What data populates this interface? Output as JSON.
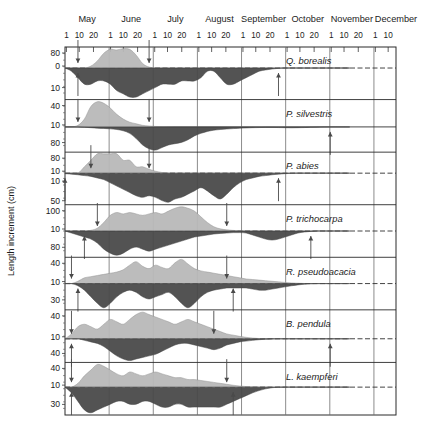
{
  "figure": {
    "y_axis_label": "Length increment (cm)",
    "x_axis_months": [
      "May",
      "June",
      "July",
      "August",
      "September",
      "October",
      "November",
      "December"
    ],
    "x_tick_labels_per_month": [
      "1",
      "10",
      "20"
    ],
    "x_last_month_ticks": [
      "1",
      "10"
    ],
    "colors": {
      "shoot_fill": "#b9b9b9",
      "root_fill": "#4a4a4a",
      "frame": "#2a2a2a",
      "gridline": "#6f6f6f",
      "baseline": "#2f2f2f",
      "arrow": "#4a4a4a",
      "background": "#ffffff"
    }
  },
  "chart_data": {
    "type": "area",
    "title": "",
    "subtitle": "",
    "xlabel": "",
    "ylabel": "Length increment (cm)",
    "grid": true,
    "legend_position": "none",
    "x_axis": {
      "type": "date-of-year",
      "months": [
        "May",
        "June",
        "July",
        "August",
        "September",
        "October",
        "November",
        "December"
      ],
      "minor_ticks": [
        1,
        10,
        20
      ],
      "range_start_day": 121,
      "range_end_day": 345
    },
    "series_names": [
      "shoot increment (above axis, light grey)",
      "root increment (below axis, dark grey)"
    ],
    "panels": [
      {
        "species": "Q. borealis",
        "y_ticks_above": [
          80,
          0
        ],
        "y_ticks_below": [
          10
        ],
        "above_scale_max": 80,
        "below_scale_max": 10,
        "baseline_style": "dashed",
        "shoot_profile": [
          0,
          0,
          0,
          0,
          6,
          22,
          46,
          58,
          56,
          60,
          58,
          40,
          14,
          3,
          0,
          0,
          0,
          0,
          0,
          0,
          0,
          0,
          0,
          0,
          0,
          0,
          0,
          0,
          0,
          0,
          0,
          0,
          0,
          0,
          0,
          0,
          0,
          0,
          0,
          0,
          0,
          0,
          0,
          0,
          0
        ],
        "root_profile": [
          0,
          1,
          3,
          5,
          5,
          4,
          4,
          5,
          7,
          8,
          9,
          9,
          8,
          7,
          6,
          5,
          5,
          5,
          4,
          4,
          4,
          3,
          1,
          1,
          3,
          5,
          5,
          4,
          3,
          2,
          1,
          0.6,
          0.3,
          0.1,
          0,
          0,
          0,
          0,
          0,
          0,
          0,
          0,
          0,
          0,
          0
        ],
        "arrows": [
          {
            "dir": "down",
            "label": "shoot growth start",
            "x_index": 2
          },
          {
            "dir": "up",
            "label": "root growth start",
            "x_index": 2
          },
          {
            "dir": "down",
            "label": "shoot growth end",
            "x_index": 13
          },
          {
            "dir": "up",
            "label": "root growth end",
            "x_index": 33
          }
        ]
      },
      {
        "species": "P. silvestris",
        "y_ticks_above": [
          40,
          10
        ],
        "y_ticks_below": [
          80
        ],
        "above_scale_max": 40,
        "below_scale_max": 80,
        "baseline_style": "solid",
        "shoot_profile": [
          0,
          0,
          1,
          5,
          13,
          16,
          15,
          12,
          8,
          5,
          3,
          2,
          1,
          0.6,
          0.3,
          0.2,
          0.1,
          0,
          0,
          0,
          0,
          0,
          0,
          0,
          0,
          0,
          0,
          0,
          0,
          0,
          0,
          0,
          0,
          0,
          0,
          0,
          0,
          0,
          0,
          0,
          0,
          0,
          0,
          0,
          0
        ],
        "root_profile": [
          0,
          0,
          0,
          0.3,
          0.6,
          1,
          1.2,
          1.5,
          2,
          3,
          5,
          9,
          14,
          17,
          18,
          16,
          14,
          13,
          12,
          10,
          7,
          5,
          3.5,
          2.5,
          2,
          1.6,
          1.3,
          1,
          0.8,
          0.6,
          0.5,
          0.4,
          0.4,
          0.5,
          0.6,
          0.7,
          0.6,
          0.5,
          0.3,
          0.2,
          0.1,
          0,
          0,
          0,
          0
        ],
        "arrows": [
          {
            "dir": "down",
            "label": "shoot growth start",
            "x_index": 2
          },
          {
            "dir": "down",
            "label": "shoot growth end",
            "x_index": 13
          },
          {
            "dir": "up",
            "label": "root growth end",
            "x_index": 41
          }
        ]
      },
      {
        "species": "P. abies",
        "y_ticks_above": [
          80,
          10
        ],
        "y_ticks_below": [
          10,
          50
        ],
        "above_scale_max": 80,
        "below_scale_max": 50,
        "baseline_style": "dashed",
        "shoot_profile": [
          0,
          0,
          0,
          1,
          2,
          3,
          3,
          3,
          3,
          2,
          2,
          1,
          1,
          0.6,
          0.3,
          0.1,
          0,
          0,
          0,
          0,
          0,
          0,
          0,
          0,
          0,
          0,
          0,
          0,
          0,
          0,
          0,
          0,
          0,
          0,
          0,
          0,
          0,
          0,
          0,
          0,
          0,
          0,
          0,
          0,
          0
        ],
        "root_profile": [
          0.3,
          0.6,
          1,
          1.5,
          2,
          3,
          4,
          6,
          8,
          10,
          12,
          14,
          15,
          14,
          15,
          17,
          18,
          16,
          15,
          13,
          11,
          9,
          11,
          14,
          16,
          13,
          9,
          6,
          4,
          3,
          2,
          1.5,
          1,
          0.6,
          0.3,
          0.1,
          0,
          0,
          0,
          0,
          0,
          0,
          0,
          0,
          0
        ],
        "arrows": [
          {
            "dir": "up",
            "label": "root growth start",
            "x_index": 0
          },
          {
            "dir": "down",
            "label": "shoot growth start",
            "x_index": 4
          },
          {
            "dir": "down",
            "label": "shoot growth end",
            "x_index": 13
          },
          {
            "dir": "up",
            "label": "root growth end",
            "x_index": 33
          }
        ]
      },
      {
        "species": "P. trichocarpa",
        "y_ticks_above": [
          100,
          10
        ],
        "y_ticks_below": [
          80
        ],
        "above_scale_max": 100,
        "below_scale_max": 80,
        "baseline_style": "dashed",
        "shoot_profile": [
          0,
          0,
          0,
          0,
          0.5,
          2,
          6,
          11,
          13,
          12,
          13,
          12,
          11,
          12,
          13,
          12,
          14,
          16,
          17,
          16,
          14,
          10,
          6,
          3,
          1.5,
          0.8,
          0.4,
          0.2,
          0,
          0,
          0,
          0,
          0,
          0,
          0,
          0,
          0,
          0,
          0,
          0,
          0,
          0,
          0,
          0,
          0
        ],
        "root_profile": [
          0,
          1,
          2,
          3,
          4,
          6,
          9,
          11,
          12,
          11,
          9,
          8,
          9,
          10,
          9,
          8,
          7,
          6,
          5,
          4,
          3,
          2.5,
          2,
          1.5,
          1.2,
          1,
          0.8,
          0.8,
          1,
          2,
          3,
          4,
          4.5,
          4,
          3,
          2,
          1,
          0.5,
          0.2,
          0,
          0,
          0,
          0,
          0,
          0
        ],
        "arrows": [
          {
            "dir": "down",
            "label": "shoot growth start",
            "x_index": 5
          },
          {
            "dir": "up",
            "label": "root growth start",
            "x_index": 3
          },
          {
            "dir": "down",
            "label": "shoot growth end",
            "x_index": 25
          },
          {
            "dir": "up",
            "label": "root growth end",
            "x_index": 38
          }
        ]
      },
      {
        "species": "R. pseudoacacia",
        "y_ticks_above": [
          40,
          10
        ],
        "y_ticks_below": [
          30
        ],
        "above_scale_max": 40,
        "below_scale_max": 30,
        "baseline_style": "dashed",
        "shoot_profile": [
          0,
          0,
          2,
          5,
          6,
          7,
          8,
          9,
          10,
          12,
          16,
          19,
          15,
          13,
          16,
          14,
          13,
          18,
          21,
          17,
          13,
          11,
          10,
          9,
          8,
          7,
          6,
          5,
          4,
          3.5,
          3,
          2.5,
          2,
          1.5,
          1,
          0.6,
          0.3,
          0.1,
          0,
          0,
          0,
          0,
          0,
          0,
          0
        ],
        "root_profile": [
          0,
          0,
          1,
          3,
          6,
          9,
          11,
          9,
          6,
          4,
          3,
          4,
          6,
          7,
          6,
          5,
          4,
          6,
          9,
          11,
          9,
          6,
          4,
          3,
          2.5,
          2,
          2,
          2,
          2,
          2.5,
          3,
          3,
          2.5,
          2,
          1.5,
          1,
          0.6,
          0.3,
          0.1,
          0,
          0,
          0,
          0,
          0,
          0
        ],
        "arrows": [
          {
            "dir": "down",
            "label": "shoot growth start",
            "x_index": 1
          },
          {
            "dir": "up",
            "label": "root growth start",
            "x_index": 2
          },
          {
            "dir": "down",
            "label": "shoot growth end",
            "x_index": 25
          },
          {
            "dir": "up",
            "label": "root growth end",
            "x_index": 26
          }
        ]
      },
      {
        "species": "B. pendula",
        "y_ticks_above": [
          40,
          10
        ],
        "y_ticks_below": [
          40
        ],
        "above_scale_max": 40,
        "below_scale_max": 40,
        "baseline_style": "dashed",
        "shoot_profile": [
          0,
          2,
          5,
          6,
          5,
          4,
          6,
          8,
          7,
          6,
          8,
          10,
          11,
          10,
          9,
          8,
          7,
          6,
          7,
          8,
          7,
          6,
          5,
          4,
          3,
          2,
          1.5,
          1,
          0.6,
          0.3,
          0.1,
          0,
          0,
          0,
          0,
          0,
          0,
          0,
          0,
          0,
          0,
          0,
          0,
          0,
          0
        ],
        "root_profile": [
          0,
          0,
          0,
          1,
          2,
          3,
          5,
          8,
          11,
          13,
          14,
          13,
          12,
          11,
          10,
          8,
          6,
          4,
          3,
          3,
          4,
          5,
          6,
          7,
          6,
          4,
          3,
          2,
          1.5,
          1,
          0.6,
          0.3,
          0.1,
          0,
          0,
          0,
          0,
          0,
          0,
          0,
          0,
          0,
          0,
          0,
          0
        ],
        "arrows": [
          {
            "dir": "down",
            "label": "shoot growth start",
            "x_index": 1
          },
          {
            "dir": "up",
            "label": "root growth start",
            "x_index": 1
          },
          {
            "dir": "down",
            "label": "shoot growth end",
            "x_index": 23
          },
          {
            "dir": "up",
            "label": "root growth end",
            "x_index": 41
          }
        ]
      },
      {
        "species": "L. kaempferi",
        "y_ticks_above": [
          40,
          10
        ],
        "y_ticks_below": [
          30
        ],
        "above_scale_max": 40,
        "below_scale_max": 30,
        "baseline_style": "dashed",
        "shoot_profile": [
          0,
          0,
          2,
          6,
          9,
          12,
          11,
          9,
          7,
          6,
          8,
          7,
          6,
          7,
          8,
          7,
          6,
          5,
          5,
          4,
          4,
          3.5,
          3,
          2.5,
          2,
          1.5,
          1,
          0.6,
          0.3,
          0.1,
          0,
          0,
          0,
          0,
          0,
          0,
          0,
          0,
          0,
          0,
          0,
          0,
          0,
          0,
          0
        ],
        "root_profile": [
          0,
          2,
          5,
          8,
          9,
          8,
          7,
          6,
          5,
          5,
          6,
          6,
          5,
          5,
          6,
          7,
          7,
          6,
          6,
          7,
          7,
          7,
          7,
          7,
          7,
          6,
          5,
          4,
          3,
          2,
          1.2,
          0.6,
          0.2,
          0,
          0,
          0,
          0,
          0,
          0,
          0,
          0,
          0,
          0,
          0,
          0
        ],
        "arrows": [
          {
            "dir": "down",
            "label": "shoot growth start",
            "x_index": 1
          },
          {
            "dir": "up",
            "label": "root growth start",
            "x_index": 1
          },
          {
            "dir": "down",
            "label": "shoot growth end",
            "x_index": 25
          },
          {
            "dir": "up",
            "label": "root growth end",
            "x_index": 26
          }
        ]
      }
    ]
  }
}
